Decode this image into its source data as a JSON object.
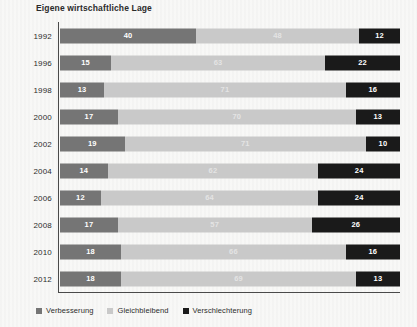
{
  "chart_data": {
    "type": "bar",
    "subtype": "stacked-horizontal-100",
    "title": "Eigene wirtschaftliche Lage",
    "xlabel": "",
    "ylabel": "",
    "xlim": [
      0,
      100
    ],
    "grid": false,
    "legend_position": "bottom-left",
    "categories": [
      "1992",
      "1996",
      "1998",
      "2000",
      "2002",
      "2004",
      "2006",
      "2008",
      "2010",
      "2012"
    ],
    "series": [
      {
        "name": "Verbesserung",
        "color": "#757575",
        "values": [
          40,
          15,
          13,
          17,
          19,
          14,
          12,
          17,
          18,
          18
        ]
      },
      {
        "name": "Gleichbleibend",
        "color": "#c9c9c9",
        "values": [
          48,
          63,
          71,
          70,
          71,
          62,
          64,
          57,
          66,
          69
        ]
      },
      {
        "name": "Verschlechterung",
        "color": "#1a1a1a",
        "values": [
          12,
          22,
          16,
          13,
          10,
          24,
          24,
          26,
          16,
          13
        ]
      }
    ]
  },
  "legend": {
    "items": [
      {
        "label": "Verbesserung",
        "color": "#757575"
      },
      {
        "label": "Gleichbleibend",
        "color": "#c9c9c9"
      },
      {
        "label": "Verschlechterung",
        "color": "#1a1a1a"
      }
    ]
  }
}
